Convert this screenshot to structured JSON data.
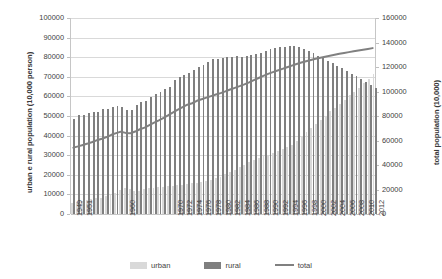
{
  "chart_data": {
    "type": "bar",
    "title": "",
    "subtitle": "",
    "xlabel": "",
    "ylabel": "urban e rural population (10,000 person)",
    "y2label": "total population (10,000)",
    "ylim": [
      0,
      100000
    ],
    "y2lim": [
      0,
      160000
    ],
    "ytick_labels": [
      "100000",
      "90000",
      "80000",
      "70000",
      "60000",
      "50000",
      "40000",
      "30000",
      "20000",
      "10000",
      "0"
    ],
    "ytick_values": [
      100000,
      90000,
      80000,
      70000,
      60000,
      50000,
      40000,
      30000,
      20000,
      10000,
      0
    ],
    "y2tick_labels": [
      "160000",
      "140000",
      "120000",
      "100000",
      "80000",
      "60000",
      "40000",
      "20000",
      "0"
    ],
    "y2tick_values": [
      160000,
      140000,
      120000,
      100000,
      80000,
      60000,
      40000,
      20000,
      0
    ],
    "grid": true,
    "legend_position": "bottom",
    "legend": [
      "urban",
      "rural",
      "total"
    ],
    "colors": {
      "urban": "#d9d9d9",
      "rural": "#7f7f7f",
      "total": "#808080",
      "gridline": "#d9d9d9",
      "axis": "#c6c6c6",
      "text": "#3f3f3f"
    },
    "x": [
      1949,
      1950,
      1951,
      1952,
      1953,
      1954,
      1955,
      1956,
      1957,
      1958,
      1959,
      1960,
      1961,
      1962,
      1963,
      1964,
      1965,
      1966,
      1967,
      1968,
      1969,
      1970,
      1971,
      1972,
      1973,
      1974,
      1975,
      1976,
      1977,
      1978,
      1979,
      1980,
      1981,
      1982,
      1983,
      1984,
      1985,
      1986,
      1987,
      1988,
      1989,
      1990,
      1991,
      1992,
      1993,
      1994,
      1995,
      1996,
      1997,
      1998,
      1999,
      2000,
      2001,
      2002,
      2003,
      2004,
      2005,
      2006,
      2007,
      2008,
      2009,
      2010,
      2011,
      2012
    ],
    "xtick_labels": [
      "1949",
      "1951",
      "1960",
      "1970",
      "1972",
      "1974",
      "1976",
      "1978",
      "1980",
      "1982",
      "1984",
      "1986",
      "1988",
      "1990",
      "1992",
      "1994",
      "1996",
      "1998",
      "2000",
      "2002",
      "2004",
      "2006",
      "2008",
      "2010",
      "2012"
    ],
    "series": [
      {
        "name": "urban",
        "axis": "left",
        "values": [
          5765,
          6169,
          6632,
          7163,
          7826,
          8249,
          8285,
          9185,
          9949,
          10721,
          12371,
          13073,
          12707,
          11659,
          11646,
          12950,
          13045,
          13313,
          13548,
          13838,
          14117,
          14424,
          14711,
          14935,
          15345,
          15595,
          16030,
          16341,
          16669,
          17245,
          18495,
          19140,
          20171,
          21480,
          22274,
          24017,
          25094,
          26366,
          27674,
          28661,
          29540,
          30195,
          31203,
          32175,
          33173,
          34169,
          35174,
          37304,
          39449,
          41608,
          43748,
          45906,
          48064,
          50212,
          52376,
          54283,
          56212,
          58288,
          60633,
          62403,
          64512,
          66978,
          69079,
          71182
        ],
        "description": "urban population, 10,000 persons"
      },
      {
        "name": "rural",
        "axis": "left",
        "values": [
          48402,
          50319,
          50749,
          51496,
          51821,
          52245,
          53398,
          53699,
          54704,
          55273,
          54836,
          53134,
          53152,
          55636,
          57306,
          57833,
          59493,
          61329,
          62440,
          63679,
          64982,
          68568,
          69685,
          71017,
          72152,
          73474,
          74858,
          76109,
          77357,
          79014,
          79047,
          79565,
          79901,
          80174,
          80734,
          80340,
          80757,
          81141,
          81626,
          82365,
          83164,
          84138,
          84620,
          84996,
          85344,
          85681,
          85947,
          85085,
          84177,
          83153,
          82038,
          80837,
          79563,
          78241,
          76851,
          75705,
          74544,
          73160,
          71496,
          70399,
          68938,
          67113,
          65656,
          64222
        ],
        "description": "rural population, 10,000 persons"
      },
      {
        "name": "total",
        "axis": "right",
        "values": [
          54167,
          55196,
          56300,
          57482,
          58796,
          60266,
          61465,
          62828,
          64653,
          65994,
          67207,
          66207,
          65859,
          67295,
          69172,
          70499,
          72538,
          74542,
          76368,
          78534,
          80671,
          82992,
          85229,
          87177,
          89211,
          90409,
          92420,
          93717,
          94974,
          96259,
          97542,
          98705,
          100072,
          101654,
          103008,
          104357,
          105851,
          107507,
          109300,
          111026,
          112704,
          114333,
          115823,
          117171,
          118517,
          119850,
          121121,
          122389,
          123626,
          124761,
          125786,
          126743,
          127627,
          128453,
          129227,
          129988,
          130756,
          131448,
          132129,
          132802,
          133450,
          134091,
          134735,
          135404
        ],
        "description": "total population, 10,000 persons"
      }
    ]
  }
}
